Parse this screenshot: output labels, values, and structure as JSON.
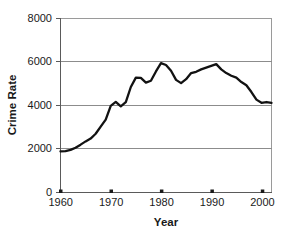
{
  "chart_data": {
    "type": "line",
    "title": "",
    "xlabel": "Year",
    "ylabel": "Crime Rate",
    "xlim": [
      1960,
      2002
    ],
    "ylim": [
      0,
      8000
    ],
    "grid": true,
    "legend": "none",
    "xticks": [
      1960,
      1970,
      1980,
      1990,
      2000
    ],
    "xtick_labels": [
      "1960",
      "1970",
      "1980",
      "1990",
      "2000"
    ],
    "yticks": [
      0,
      2000,
      4000,
      6000,
      8000
    ],
    "ytick_labels": [
      "0",
      "2000",
      "4000",
      "6000",
      "8000"
    ],
    "series": [
      {
        "name": "Crime Rate",
        "color": "#121212",
        "x": [
          1960,
          1961,
          1962,
          1963,
          1964,
          1965,
          1966,
          1967,
          1968,
          1969,
          1970,
          1971,
          1972,
          1973,
          1974,
          1975,
          1976,
          1977,
          1978,
          1979,
          1980,
          1981,
          1982,
          1983,
          1984,
          1985,
          1986,
          1987,
          1988,
          1989,
          1990,
          1991,
          1992,
          1993,
          1994,
          1995,
          1996,
          1997,
          1998,
          1999,
          2000,
          2001,
          2002
        ],
        "values": [
          1890,
          1900,
          1960,
          2060,
          2200,
          2350,
          2480,
          2700,
          3030,
          3350,
          3985,
          4165,
          3960,
          4155,
          4850,
          5280,
          5270,
          5055,
          5140,
          5565,
          5950,
          5860,
          5600,
          5180,
          5030,
          5210,
          5490,
          5550,
          5660,
          5740,
          5820,
          5900,
          5660,
          5490,
          5370,
          5280,
          5080,
          4930,
          4620,
          4270,
          4125,
          4160,
          4120
        ]
      }
    ]
  },
  "axis": {
    "y_title": "Crime Rate",
    "x_title": "Year"
  }
}
